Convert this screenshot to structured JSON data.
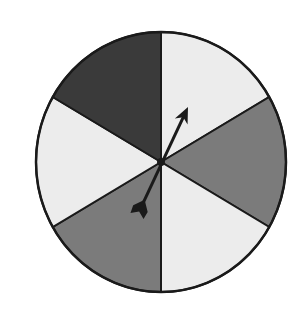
{
  "spinner": {
    "center": [
      161,
      162
    ],
    "radius": 125,
    "sectors": [
      {
        "name": "top-right",
        "start": -90,
        "end": -30,
        "color": "#ececec",
        "shade": "light"
      },
      {
        "name": "right",
        "start": -30,
        "end": 30,
        "color": "#7b7b7b",
        "shade": "medium"
      },
      {
        "name": "bottom-right",
        "start": 30,
        "end": 90,
        "color": "#ececec",
        "shade": "light"
      },
      {
        "name": "bottom-left",
        "start": 90,
        "end": 150,
        "color": "#7b7b7b",
        "shade": "medium"
      },
      {
        "name": "left",
        "start": 150,
        "end": 210,
        "color": "#ececec",
        "shade": "light"
      },
      {
        "name": "top-left",
        "start": 210,
        "end": 270,
        "color": "#3a3a3a",
        "shade": "dark"
      }
    ],
    "arrow": {
      "tip": [
        188,
        107
      ],
      "tail": [
        137,
        216
      ],
      "color": "#1a1a1a"
    },
    "outline_color": "#1a1a1a"
  }
}
